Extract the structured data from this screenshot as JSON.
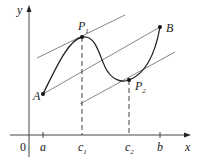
{
  "diagram": {
    "axes": {
      "x_label": "x",
      "y_label": "y",
      "origin_label": "0"
    },
    "tick_labels": [
      {
        "main": "a",
        "sub": ""
      },
      {
        "main": "c",
        "sub": "1"
      },
      {
        "main": "c",
        "sub": "2"
      },
      {
        "main": "b",
        "sub": ""
      }
    ],
    "points": [
      {
        "main": "A",
        "sub": ""
      },
      {
        "main": "P",
        "sub": "1"
      },
      {
        "main": "P",
        "sub": "2"
      },
      {
        "main": "B",
        "sub": ""
      }
    ],
    "colors": {
      "curve": "#222222",
      "tangent": "#555555",
      "axis": "#444444"
    }
  }
}
